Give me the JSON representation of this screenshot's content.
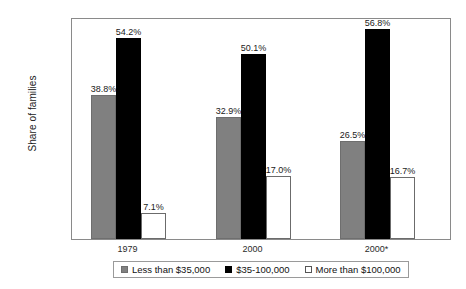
{
  "chart_data": {
    "type": "bar",
    "title": "",
    "xlabel": "",
    "ylabel": "Share of families",
    "categories": [
      "1979",
      "2000",
      "2000*"
    ],
    "series": [
      {
        "name": "Less than $35,000",
        "color": "#808080",
        "values": [
          38.8,
          32.9,
          26.5
        ],
        "labels": [
          "38.8%",
          "32.9%",
          "26.5%"
        ]
      },
      {
        "name": "$35-100,000",
        "color": "#000000",
        "values": [
          54.2,
          50.1,
          56.8
        ],
        "labels": [
          "54.2%",
          "50.1%",
          "56.8%"
        ]
      },
      {
        "name": "More than $100,000",
        "color": "#ffffff",
        "values": [
          7.1,
          17.0,
          16.7
        ],
        "labels": [
          "7.1%",
          "17.0%",
          "16.7%"
        ]
      }
    ],
    "ylim": [
      0,
      60
    ],
    "ytick_values": [
      0,
      10,
      20,
      30,
      40,
      50,
      60
    ],
    "ytick_labels": [
      "0.0%",
      "10.0%",
      "20.0%",
      "30.0%",
      "40.0%",
      "50.0%",
      "60.0%"
    ],
    "grid": false,
    "legend_position": "bottom"
  },
  "axis": {
    "y_title": "Share of families"
  },
  "legend": {
    "items": [
      {
        "label": "Less than $35,000"
      },
      {
        "label": "$35-100,000"
      },
      {
        "label": "More than $100,000"
      }
    ]
  }
}
